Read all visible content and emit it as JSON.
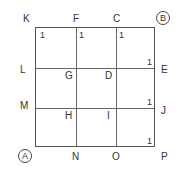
{
  "points": {
    "K": "K",
    "F": "F",
    "C": "C",
    "B": "B",
    "L": "L",
    "G": "G",
    "D": "D",
    "E": "E",
    "M": "M",
    "H": "H",
    "I": "I",
    "J": "J",
    "A": "A",
    "N": "N",
    "O": "O",
    "P": "P"
  },
  "edge_weights": {
    "w1": "1",
    "w2": "1",
    "w3": "1",
    "w4": "1",
    "w5": "1",
    "w6": "1"
  },
  "colors": {
    "line": "#666666",
    "text": "#333333"
  }
}
